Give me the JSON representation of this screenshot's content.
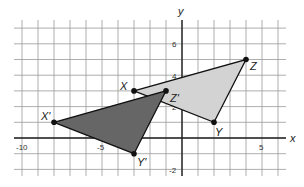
{
  "diagram": {
    "type": "coordinate-plane-translation",
    "axes": {
      "x_label": "x",
      "y_label": "y",
      "x_range": [
        -10.5,
        6.5
      ],
      "y_range": [
        -2.5,
        7.5
      ]
    },
    "tick_labels": {
      "x": [
        "-10",
        "-5",
        "5"
      ],
      "y": [
        "6",
        "4",
        "2",
        "-2"
      ]
    },
    "original_triangle": {
      "fill": "#d3d3d3",
      "vertices": [
        {
          "name": "X",
          "x": -3,
          "y": 3
        },
        {
          "name": "Y",
          "x": 2,
          "y": 1
        },
        {
          "name": "Z",
          "x": 4,
          "y": 5
        }
      ]
    },
    "image_triangle": {
      "fill": "#666666",
      "vertices": [
        {
          "name": "X'",
          "x": -8,
          "y": 1
        },
        {
          "name": "Y'",
          "x": -3,
          "y": -1
        },
        {
          "name": "Z'",
          "x": -1,
          "y": 3
        }
      ]
    }
  }
}
